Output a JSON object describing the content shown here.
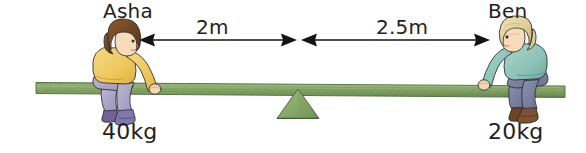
{
  "diagram": {
    "background_color": "#ffffff",
    "people": [
      {
        "id": "asha",
        "name": "Asha",
        "mass": "40kg",
        "side": "left",
        "hair_color": "#6b4423",
        "shirt_color": "#f0c85a",
        "trouser_color": "#a9a3c4",
        "shoe_color": "#7a6d9e",
        "skin_color": "#f5d9b8"
      },
      {
        "id": "ben",
        "name": "Ben",
        "mass": "20kg",
        "side": "right",
        "hair_color": "#ddd0a0",
        "shirt_color": "#8fc4bb",
        "trouser_color": "#7a7f9e",
        "shoe_color": "#6b4626",
        "skin_color": "#f5d9b8"
      }
    ],
    "dimensions": [
      {
        "id": "left-span",
        "label": "2m",
        "from": "asha",
        "to": "fulcrum"
      },
      {
        "id": "right-span",
        "label": "2.5m",
        "from": "fulcrum",
        "to": "ben"
      }
    ],
    "plank": {
      "color": "#7d9c5f",
      "edge_color": "#5d7a45",
      "highlight_color": "#9ab880"
    },
    "fulcrum": {
      "color": "#8cab6c",
      "edge_color": "#4f6b3a",
      "shape": "triangle"
    },
    "arrow_color": "#1a1a1a"
  }
}
